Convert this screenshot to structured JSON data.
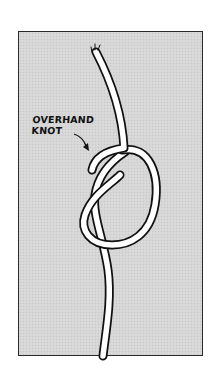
{
  "illustration": {
    "subject": "rope-with-overhand-knot",
    "label_lines": [
      "OVERHAND",
      "KNOT"
    ],
    "colors": {
      "background": "#ffffff",
      "panel": "#d6d6d6",
      "border": "#2a2a2a",
      "rope_fill": "#ffffff",
      "rope_outline": "#111111"
    }
  }
}
